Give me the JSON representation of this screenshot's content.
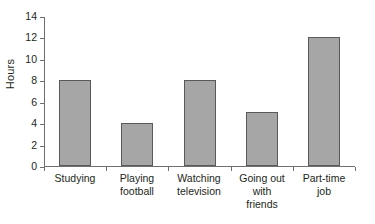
{
  "chart_data": {
    "type": "bar",
    "title": "",
    "xlabel": "",
    "ylabel": "Hours",
    "categories": [
      "Studying",
      "Playing football",
      "Watching television",
      "Going out with friends",
      "Part-time job"
    ],
    "category_lines": [
      [
        "Studying"
      ],
      [
        "Playing",
        "football"
      ],
      [
        "Watching",
        "television"
      ],
      [
        "Going out",
        "with",
        "friends"
      ],
      [
        "Part-time",
        "job"
      ]
    ],
    "values": [
      8,
      4,
      8,
      5,
      12
    ],
    "ylim": [
      0,
      14
    ],
    "ytick_step": 2,
    "ytick_labels": [
      "0",
      "2",
      "4",
      "6",
      "8",
      "10",
      "12",
      "14"
    ],
    "grid": false,
    "legend": false,
    "colors": {
      "bar_fill": "#a6a6a6",
      "bar_border": "#595959",
      "axis": "#6f6f6f",
      "text": "#231f20",
      "background": "#ffffff"
    }
  }
}
